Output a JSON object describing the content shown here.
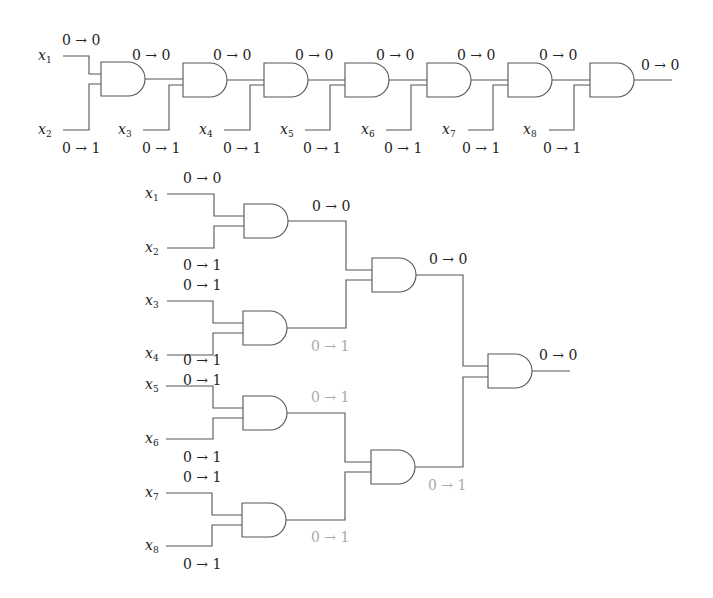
{
  "colors": {
    "wire": "#555555",
    "label": "#222222",
    "faint_label": "#aaaaaa",
    "background": "#ffffff"
  },
  "chain_circuit": {
    "inputs": [
      {
        "name": "x",
        "sub": "1",
        "transition": "0 → 0"
      },
      {
        "name": "x",
        "sub": "2",
        "transition": "0 → 1"
      },
      {
        "name": "x",
        "sub": "3",
        "transition": "0 → 1"
      },
      {
        "name": "x",
        "sub": "4",
        "transition": "0 → 1"
      },
      {
        "name": "x",
        "sub": "5",
        "transition": "0 → 1"
      },
      {
        "name": "x",
        "sub": "6",
        "transition": "0 → 1"
      },
      {
        "name": "x",
        "sub": "7",
        "transition": "0 → 1"
      },
      {
        "name": "x",
        "sub": "8",
        "transition": "0 → 1"
      }
    ],
    "gate_outputs": [
      "0 → 0",
      "0 → 0",
      "0 → 0",
      "0 → 0",
      "0 → 0",
      "0 → 0",
      "0 → 0"
    ]
  },
  "tree_circuit": {
    "inputs": [
      {
        "name": "x",
        "sub": "1",
        "transition": "0 → 0"
      },
      {
        "name": "x",
        "sub": "2",
        "transition": "0 → 1"
      },
      {
        "name": "x",
        "sub": "3",
        "transition": "0 → 1"
      },
      {
        "name": "x",
        "sub": "4",
        "transition": "0 → 1"
      },
      {
        "name": "x",
        "sub": "5",
        "transition": "0 → 1"
      },
      {
        "name": "x",
        "sub": "6",
        "transition": "0 → 1"
      },
      {
        "name": "x",
        "sub": "7",
        "transition": "0 → 1"
      },
      {
        "name": "x",
        "sub": "8",
        "transition": "0 → 1"
      }
    ],
    "level1_outputs": [
      "0 → 0",
      "0 → 1",
      "0 → 1",
      "0 → 1"
    ],
    "level2_outputs": [
      "0 → 0",
      "0 → 1"
    ],
    "final_output": "0 → 0"
  }
}
